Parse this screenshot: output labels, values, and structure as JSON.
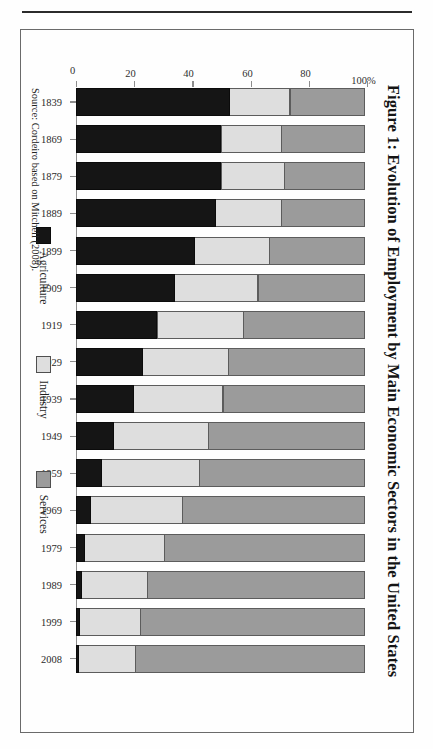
{
  "figure": {
    "title": "Figure 1: Evolution of Employment by Main Economic Sectors in the United States",
    "source": "Source: Cordeiro based on Mitchell (2008)."
  },
  "legend": {
    "items": [
      {
        "label": "Agriculture",
        "color": "#151515",
        "name": "legend-agriculture"
      },
      {
        "label": "Industry",
        "color": "#dedede",
        "name": "legend-industry"
      },
      {
        "label": "Services",
        "color": "#9b9b9b",
        "name": "legend-services"
      }
    ]
  },
  "axis": {
    "tick_labels": [
      "100%",
      "80",
      "60",
      "40",
      "20",
      "0"
    ],
    "tick_values": [
      100,
      80,
      60,
      40,
      20,
      0
    ]
  },
  "chart_data": {
    "type": "bar",
    "title": "Figure 1: Evolution of Employment by Main Economic Sectors in the United States",
    "subtitle": "",
    "xlabel": "",
    "ylabel": "",
    "ylim": [
      0,
      100
    ],
    "stacked": true,
    "orientation": "vertical",
    "grid": false,
    "legend_position": "bottom",
    "note": "Source: Cordeiro based on Mitchell (2008).",
    "categories": [
      "1839",
      "1869",
      "1879",
      "1889",
      "1899",
      "1909",
      "1919",
      "1929",
      "1939",
      "1949",
      "1959",
      "1969",
      "1979",
      "1989",
      "1999",
      "2008"
    ],
    "series": [
      {
        "name": "Agriculture",
        "color": "#151515",
        "values": [
          53,
          50,
          50,
          48,
          41,
          34,
          28,
          23,
          20,
          13,
          9,
          5,
          3,
          2,
          1.5,
          1
        ]
      },
      {
        "name": "Industry",
        "color": "#dedede",
        "values": [
          21,
          21,
          22,
          23,
          26,
          29,
          30,
          30,
          31,
          33,
          34,
          32,
          28,
          23,
          21,
          20
        ]
      },
      {
        "name": "Services",
        "color": "#9b9b9b",
        "values": [
          26,
          29,
          28,
          29,
          33,
          37,
          42,
          47,
          49,
          54,
          57,
          63,
          69,
          75,
          77.5,
          79
        ]
      }
    ]
  }
}
